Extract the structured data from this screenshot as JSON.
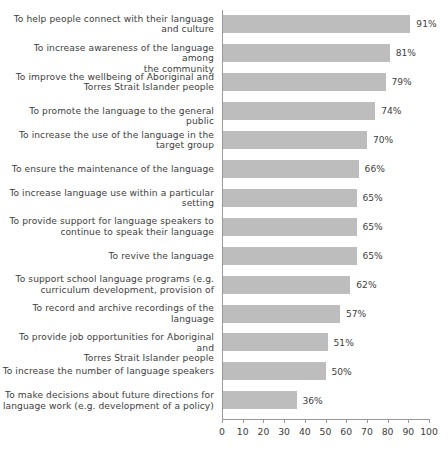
{
  "chart_data": {
    "type": "bar",
    "orientation": "horizontal",
    "title": "",
    "subtitle": "",
    "xlabel": "",
    "ylabel": "",
    "xlim": [
      0,
      100
    ],
    "xticks": [
      0,
      10,
      20,
      30,
      40,
      50,
      60,
      70,
      80,
      90,
      100
    ],
    "xtick_labels": [
      "0",
      "10",
      "20",
      "30",
      "40",
      "50",
      "60",
      "70",
      "80",
      "90",
      "100"
    ],
    "grid": false,
    "legend": null,
    "value_suffix": "%",
    "bar_color": "#bdbdbd",
    "axis_color": "#9a9a9a",
    "text_color": "#3d3d3d",
    "categories": [
      "To help people connect with their language and culture",
      "To increase awareness of the language among the community",
      "To improve the wellbeing of Aboriginal and Torres Strait Islander people",
      "To promote the language to the general public",
      "To increase the use of the language in the target group",
      "To ensure the maintenance of the language",
      "To increase language use within a particular setting",
      "To provide support for language speakers to continue to speak their language",
      "To revive the language",
      "To support school language programs (e.g. curriculum development, provision of",
      "To record and archive recordings of the language",
      "To provide job opportunities for Aboriginal and Torres Strait Islander people",
      "To increase the number of language speakers",
      "To make decisions about future directions for language work (e.g. development of a policy)"
    ],
    "values": [
      91,
      81,
      79,
      74,
      70,
      66,
      65,
      65,
      65,
      62,
      57,
      51,
      50,
      36
    ],
    "data_labels": [
      "91%",
      "81%",
      "79%",
      "74%",
      "70%",
      "66%",
      "65%",
      "65%",
      "65%",
      "62%",
      "57%",
      "51%",
      "50%",
      "36%"
    ]
  },
  "rows": [
    {
      "label": "To help people connect with their language\nand culture",
      "lines": 2,
      "value": 91,
      "value_label": "91%"
    },
    {
      "label": "To increase awareness of the language among\nthe community",
      "lines": 2,
      "value": 81,
      "value_label": "81%"
    },
    {
      "label": "To improve the wellbeing of Aboriginal and\nTorres Strait Islander people",
      "lines": 2,
      "value": 79,
      "value_label": "79%"
    },
    {
      "label": "To promote the language to the general public",
      "lines": 1,
      "value": 74,
      "value_label": "74%"
    },
    {
      "label": "To increase the use of the language in the\ntarget group",
      "lines": 2,
      "value": 70,
      "value_label": "70%"
    },
    {
      "label": "To ensure the maintenance of the language",
      "lines": 1,
      "value": 66,
      "value_label": "66%"
    },
    {
      "label": "To increase language use within a particular\nsetting",
      "lines": 2,
      "value": 65,
      "value_label": "65%"
    },
    {
      "label": "To provide support for language speakers to\ncontinue to speak their language",
      "lines": 2,
      "value": 65,
      "value_label": "65%"
    },
    {
      "label": "To revive the language",
      "lines": 1,
      "value": 65,
      "value_label": "65%"
    },
    {
      "label": "To support school language programs (e.g.\ncurriculum development, provision of",
      "lines": 2,
      "value": 62,
      "value_label": "62%"
    },
    {
      "label": "To record and archive recordings of the\nlanguage",
      "lines": 2,
      "value": 57,
      "value_label": "57%"
    },
    {
      "label": "To provide job opportunities for Aboriginal and\nTorres Strait Islander people",
      "lines": 2,
      "value": 51,
      "value_label": "51%"
    },
    {
      "label": "To increase the number of language speakers",
      "lines": 1,
      "value": 50,
      "value_label": "50%"
    },
    {
      "label": "To make decisions about future directions for\nlanguage work (e.g. development of a policy)",
      "lines": 2,
      "value": 36,
      "value_label": "36%"
    }
  ],
  "axis": {
    "ticks": [
      "0",
      "10",
      "20",
      "30",
      "40",
      "50",
      "60",
      "70",
      "80",
      "90",
      "100"
    ]
  }
}
